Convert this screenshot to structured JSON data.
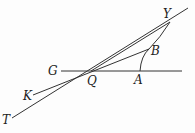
{
  "diagram": {
    "type": "geometry",
    "points": {
      "Y": {
        "label": "Y",
        "x": 170,
        "y": 22
      },
      "B": {
        "label": "B",
        "x": 149,
        "y": 50
      },
      "Q": {
        "label": "Q",
        "x": 91,
        "y": 71
      },
      "A": {
        "label": "A",
        "x": 140,
        "y": 71
      },
      "G": {
        "label": "G",
        "x": 61,
        "y": 71
      },
      "K": {
        "label": "K",
        "x": 33,
        "y": 95
      },
      "T": {
        "label": "T",
        "x": 12,
        "y": 118
      }
    },
    "lines": [
      {
        "name": "horizontal-line-GA",
        "from": "G",
        "to": "end",
        "description": "horizontal line through G, Q, A"
      },
      {
        "name": "line-TY",
        "from": "T",
        "to": "Y",
        "description": "line from T through Q to Y and beyond"
      },
      {
        "name": "line-KB",
        "from": "K",
        "to": "B",
        "description": "line from K through Q to B"
      },
      {
        "name": "curve-AY",
        "from": "A",
        "to": "Y",
        "description": "curved arc from A through B to Y"
      }
    ]
  }
}
